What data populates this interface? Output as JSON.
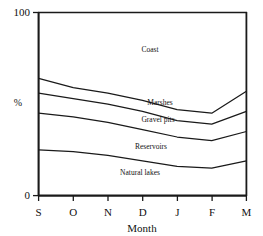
{
  "figure": {
    "top_cut_text": "",
    "xlabel": "Month",
    "ylabel": "%",
    "y_ticks": [
      "0",
      "100"
    ],
    "x_ticks": [
      "S",
      "O",
      "N",
      "D",
      "J",
      "F",
      "M"
    ],
    "line_color": "#1a1a1a",
    "background": "#ffffff"
  },
  "labels": {
    "coast": "Coast",
    "marshes": "Marshes",
    "gravel_pits": "Gravel pits",
    "reservoirs": "Reservoirs",
    "natural_lakes": "Natural lakes"
  },
  "chart_data": {
    "type": "area",
    "title": "",
    "subtitle": "",
    "xlabel": "Month",
    "ylabel": "%",
    "ylim": [
      0,
      100
    ],
    "grid": false,
    "legend": "inline-band-labels",
    "stacked": true,
    "x": [
      "S",
      "O",
      "N",
      "D",
      "J",
      "F",
      "M"
    ],
    "x_tick_labels": [
      "S",
      "O",
      "N",
      "D",
      "J",
      "F",
      "M"
    ],
    "y_tick_labels": [
      "0",
      "100"
    ],
    "note": "Stacked percentage area chart; values are percent of total and sum to 100 at each month.",
    "series": [
      {
        "name": "Natural lakes",
        "values": [
          25,
          24,
          22,
          19,
          16,
          15,
          19
        ],
        "cumulative_top": [
          25,
          24,
          22,
          19,
          16,
          15,
          19
        ]
      },
      {
        "name": "Reservoirs",
        "values": [
          20,
          19,
          18,
          17,
          16,
          15,
          16
        ],
        "cumulative_top": [
          45,
          43,
          40,
          36,
          32,
          30,
          35
        ]
      },
      {
        "name": "Gravel pits",
        "values": [
          11,
          10,
          10,
          10,
          9,
          9,
          11
        ],
        "cumulative_top": [
          56,
          53,
          50,
          46,
          41,
          39,
          46
        ]
      },
      {
        "name": "Marshes",
        "values": [
          8,
          6,
          6,
          6,
          6,
          6,
          11
        ],
        "cumulative_top": [
          64,
          59,
          56,
          52,
          47,
          45,
          57
        ]
      },
      {
        "name": "Coast",
        "values": [
          36,
          41,
          44,
          48,
          53,
          55,
          43
        ],
        "cumulative_top": [
          100,
          100,
          100,
          100,
          100,
          100,
          100
        ]
      }
    ]
  }
}
